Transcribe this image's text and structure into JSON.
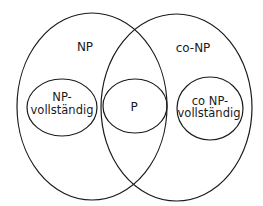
{
  "diagram": {
    "type": "venn",
    "sets": {
      "np": {
        "label": "NP"
      },
      "conp": {
        "label": "co-NP"
      },
      "np_complete": {
        "line1": "NP-",
        "line2": "vollständig"
      },
      "p": {
        "label": "P"
      },
      "conp_complete": {
        "line1": "co NP-",
        "line2": "vollständig"
      }
    },
    "colors": {
      "stroke": "#1a1a1a",
      "background": "#ffffff",
      "text": "#1a1a1a"
    }
  }
}
